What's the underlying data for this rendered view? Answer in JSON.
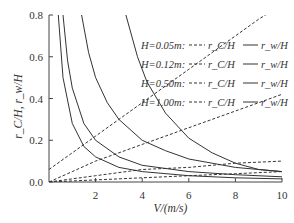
{
  "chart_data": {
    "type": "line",
    "title": "",
    "xlabel": "V/(m/s)",
    "ylabel": "r_C/H, r_w/H",
    "xlim": [
      0,
      10
    ],
    "ylim": [
      0,
      0.8
    ],
    "x_ticks": [
      "2",
      "4",
      "6",
      "8",
      "10"
    ],
    "y_ticks": [
      "0.0",
      "0.2",
      "0.4",
      "0.6",
      "0.8"
    ],
    "grid": false,
    "legend_position": "upper right",
    "legend": [
      {
        "label": "H=0.05m:",
        "dashed": "r_C/H",
        "solid": "r_w/H"
      },
      {
        "label": "H=0.12m:",
        "dashed": "r_C/H",
        "solid": "r_w/H"
      },
      {
        "label": "H=0.50m:",
        "dashed": "r_C/H",
        "solid": "r_w/H"
      },
      {
        "label": "H=1.00m:",
        "dashed": "r_C/H",
        "solid": "r_w/H"
      }
    ],
    "series": [
      {
        "name": "H=0.05m r_C/H",
        "style": "dashed",
        "x": [
          0,
          1,
          2,
          3,
          4,
          5,
          6,
          7,
          8,
          9,
          10
        ],
        "values": [
          0.06,
          0.14,
          0.22,
          0.3,
          0.38,
          0.46,
          0.54,
          0.62,
          0.7,
          0.78,
          0.85
        ]
      },
      {
        "name": "H=0.12m r_C/H",
        "style": "dashed",
        "x": [
          0,
          1,
          2,
          3,
          4,
          5,
          6,
          7,
          8,
          9,
          10
        ],
        "values": [
          0.0,
          0.05,
          0.1,
          0.14,
          0.18,
          0.22,
          0.26,
          0.3,
          0.34,
          0.38,
          0.42
        ]
      },
      {
        "name": "H=0.50m r_C/H",
        "style": "dashed",
        "x": [
          0,
          2,
          4,
          6,
          8,
          10
        ],
        "values": [
          0.0,
          0.03,
          0.06,
          0.07,
          0.09,
          0.1
        ]
      },
      {
        "name": "H=1.00m r_C/H",
        "style": "dashed",
        "x": [
          0,
          2,
          4,
          6,
          8,
          10
        ],
        "values": [
          0.0,
          0.01,
          0.02,
          0.03,
          0.04,
          0.05
        ]
      },
      {
        "name": "H=0.05m r_w/H",
        "style": "solid",
        "x": [
          0.4,
          0.6,
          1,
          1.5,
          2,
          3,
          4,
          6,
          8,
          10
        ],
        "values": [
          0.8,
          0.5,
          0.28,
          0.17,
          0.12,
          0.07,
          0.05,
          0.03,
          0.02,
          0.015
        ]
      },
      {
        "name": "H=0.12m r_w/H",
        "style": "solid",
        "x": [
          0.6,
          0.8,
          1,
          1.5,
          2,
          3,
          4,
          6,
          8,
          10
        ],
        "values": [
          0.8,
          0.58,
          0.45,
          0.28,
          0.2,
          0.12,
          0.08,
          0.05,
          0.035,
          0.025
        ]
      },
      {
        "name": "H=0.50m r_w/H",
        "style": "solid",
        "x": [
          1.4,
          1.7,
          2,
          2.5,
          3,
          4,
          5,
          6,
          8,
          10
        ],
        "values": [
          0.8,
          0.62,
          0.5,
          0.38,
          0.3,
          0.2,
          0.15,
          0.11,
          0.07,
          0.05
        ]
      },
      {
        "name": "H=1.00m r_w/H",
        "style": "solid",
        "x": [
          3.3,
          3.8,
          4.2,
          5,
          6,
          7,
          8,
          9,
          10
        ],
        "values": [
          0.8,
          0.6,
          0.48,
          0.33,
          0.21,
          0.14,
          0.09,
          0.06,
          0.05
        ]
      }
    ]
  }
}
